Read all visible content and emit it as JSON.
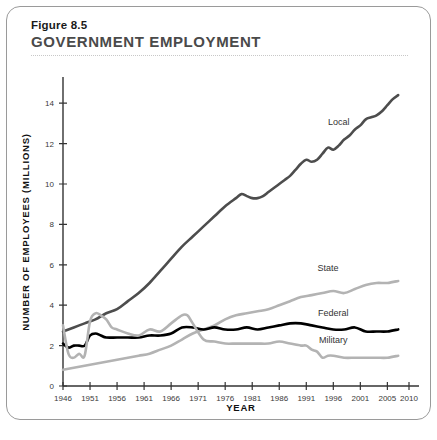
{
  "figure": {
    "number": "Figure 8.5",
    "title": "GOVERNMENT EMPLOYMENT"
  },
  "chart_data": {
    "type": "line",
    "title": "GOVERNMENT EMPLOYMENT",
    "xlabel": "YEAR",
    "ylabel": "NUMBER OF EMPLOYEES (MILLIONS)",
    "xlim": [
      1946,
      2010
    ],
    "ylim": [
      0,
      15
    ],
    "yticks": [
      0,
      2,
      4,
      6,
      8,
      10,
      12,
      14
    ],
    "ytick_labels": [
      "0",
      "2",
      "4",
      "6",
      "8",
      "10",
      "12",
      "14"
    ],
    "xticks": [
      1946,
      1951,
      1956,
      1961,
      1966,
      1971,
      1976,
      1981,
      1986,
      1991,
      1996,
      2001,
      2006,
      2010
    ],
    "xtick_labels": [
      "1946",
      "1951",
      "1956",
      "1961",
      "1966",
      "1971",
      "1976",
      "1981",
      "1986",
      "1991",
      "1996",
      "2001",
      "2005",
      "2010"
    ],
    "grid": false,
    "legend": "inline-labels",
    "colors": {
      "local": "#4d4d4d",
      "state": "#b3b3b3",
      "federal": "#000000",
      "military": "#b3b3b3"
    },
    "series": [
      {
        "name": "Local",
        "color": "#4d4d4d",
        "label_x": 1997,
        "label_y": 12.9,
        "x": [
          1946,
          1948,
          1950,
          1952,
          1954,
          1956,
          1958,
          1960,
          1962,
          1964,
          1966,
          1968,
          1970,
          1972,
          1974,
          1976,
          1978,
          1979,
          1980,
          1981,
          1982,
          1983,
          1984,
          1985,
          1986,
          1987,
          1988,
          1989,
          1990,
          1991,
          1992,
          1993,
          1994,
          1995,
          1996,
          1997,
          1998,
          1999,
          2000,
          2001,
          2002,
          2003,
          2004,
          2005,
          2006,
          2007,
          2008
        ],
        "values": [
          2.7,
          2.9,
          3.1,
          3.3,
          3.6,
          3.8,
          4.2,
          4.6,
          5.1,
          5.7,
          6.3,
          6.9,
          7.4,
          7.9,
          8.4,
          8.9,
          9.3,
          9.5,
          9.4,
          9.3,
          9.3,
          9.4,
          9.6,
          9.8,
          10.0,
          10.2,
          10.4,
          10.7,
          11.0,
          11.2,
          11.1,
          11.2,
          11.5,
          11.8,
          11.7,
          11.9,
          12.2,
          12.4,
          12.7,
          12.9,
          13.2,
          13.3,
          13.4,
          13.6,
          13.9,
          14.2,
          14.4
        ]
      },
      {
        "name": "State",
        "color": "#b3b3b3",
        "label_x": 1995,
        "label_y": 5.7,
        "x": [
          1946,
          1948,
          1950,
          1952,
          1954,
          1956,
          1958,
          1960,
          1962,
          1964,
          1966,
          1968,
          1970,
          1972,
          1974,
          1976,
          1978,
          1980,
          1982,
          1984,
          1986,
          1988,
          1990,
          1992,
          1994,
          1996,
          1998,
          2000,
          2002,
          2004,
          2006,
          2008
        ],
        "values": [
          0.8,
          0.9,
          1.0,
          1.1,
          1.2,
          1.3,
          1.4,
          1.5,
          1.6,
          1.8,
          2.0,
          2.3,
          2.6,
          2.8,
          3.0,
          3.3,
          3.5,
          3.6,
          3.7,
          3.8,
          4.0,
          4.2,
          4.4,
          4.5,
          4.6,
          4.7,
          4.6,
          4.8,
          5.0,
          5.1,
          5.1,
          5.2
        ]
      },
      {
        "name": "Federal",
        "color": "#000000",
        "label_x": 1996,
        "label_y": 3.45,
        "x": [
          1946,
          1947,
          1948,
          1949,
          1950,
          1951,
          1952,
          1953,
          1954,
          1956,
          1958,
          1960,
          1962,
          1964,
          1966,
          1968,
          1970,
          1972,
          1974,
          1976,
          1978,
          1980,
          1982,
          1984,
          1986,
          1988,
          1990,
          1992,
          1994,
          1996,
          1998,
          2000,
          2002,
          2004,
          2006,
          2008
        ],
        "values": [
          2.1,
          1.9,
          2.0,
          2.0,
          2.0,
          2.5,
          2.6,
          2.5,
          2.4,
          2.4,
          2.4,
          2.4,
          2.5,
          2.5,
          2.6,
          2.9,
          2.9,
          2.8,
          2.9,
          2.8,
          2.8,
          2.9,
          2.8,
          2.9,
          3.0,
          3.1,
          3.1,
          3.0,
          2.9,
          2.8,
          2.8,
          2.9,
          2.7,
          2.7,
          2.7,
          2.8
        ]
      },
      {
        "name": "Military",
        "color": "#b3b3b3",
        "label_x": 1996,
        "label_y": 2.15,
        "x": [
          1946,
          1947,
          1948,
          1949,
          1950,
          1951,
          1952,
          1953,
          1954,
          1955,
          1956,
          1958,
          1960,
          1962,
          1964,
          1966,
          1968,
          1969,
          1970,
          1972,
          1974,
          1976,
          1978,
          1980,
          1982,
          1984,
          1986,
          1988,
          1990,
          1991,
          1992,
          1993,
          1994,
          1995,
          1996,
          1998,
          2000,
          2002,
          2004,
          2006,
          2008
        ],
        "values": [
          3.0,
          1.6,
          1.4,
          1.6,
          1.5,
          3.2,
          3.6,
          3.5,
          3.3,
          2.9,
          2.8,
          2.6,
          2.5,
          2.8,
          2.7,
          3.1,
          3.5,
          3.5,
          3.1,
          2.3,
          2.2,
          2.1,
          2.1,
          2.1,
          2.1,
          2.1,
          2.2,
          2.1,
          2.0,
          2.0,
          1.8,
          1.7,
          1.4,
          1.5,
          1.5,
          1.4,
          1.4,
          1.4,
          1.4,
          1.4,
          1.5
        ]
      }
    ]
  }
}
